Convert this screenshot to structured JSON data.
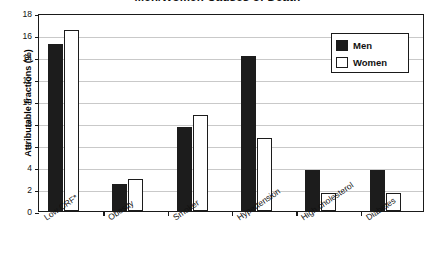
{
  "chart_data": {
    "type": "bar",
    "title": "Men/Women Causes of Death",
    "xlabel": "",
    "ylabel": "Attributable fractions (%)",
    "ylim": [
      0,
      18
    ],
    "ytick_step": 2,
    "yticks": [
      0,
      2,
      4,
      6,
      8,
      10,
      12,
      14,
      16,
      18
    ],
    "grid": true,
    "legend_position": "top-right",
    "categories": [
      "Low CRF*",
      "Obesity",
      "Smoker",
      "Hypertension",
      "High cholesterol",
      "Diabetes"
    ],
    "series": [
      {
        "name": "Men",
        "color": "#1c1c1c",
        "values": [
          15.2,
          2.5,
          7.6,
          14.1,
          3.7,
          3.7
        ]
      },
      {
        "name": "Women",
        "color": "#ffffff",
        "values": [
          16.5,
          2.9,
          8.7,
          6.6,
          1.6,
          1.6
        ]
      }
    ]
  },
  "legend": {
    "items": [
      {
        "label": "Men"
      },
      {
        "label": "Women"
      }
    ]
  },
  "colors": {
    "men_fill": "#1c1c1c",
    "women_fill": "#ffffff",
    "axis": "#1a1a1a",
    "gridline": "#c9c9c9",
    "background": "#ffffff"
  }
}
